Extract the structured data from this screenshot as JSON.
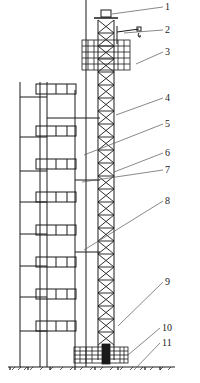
{
  "figure": {
    "type": "engineering-diagram"
  },
  "labels": [
    {
      "id": "1",
      "text": "1",
      "x": 165,
      "y": 2,
      "target": [
        112,
        14
      ]
    },
    {
      "id": "2",
      "text": "2",
      "x": 165,
      "y": 25,
      "target": [
        124,
        33
      ]
    },
    {
      "id": "3",
      "text": "3",
      "x": 165,
      "y": 47,
      "target": [
        136,
        64
      ]
    },
    {
      "id": "4",
      "text": "4",
      "x": 165,
      "y": 93,
      "target": [
        116,
        115
      ]
    },
    {
      "id": "5",
      "text": "5",
      "x": 165,
      "y": 119,
      "target": [
        84,
        155
      ]
    },
    {
      "id": "6",
      "text": "6",
      "x": 165,
      "y": 148,
      "target": [
        114,
        172
      ]
    },
    {
      "id": "7",
      "text": "7",
      "x": 165,
      "y": 165,
      "target": [
        82,
        182
      ]
    },
    {
      "id": "8",
      "text": "8",
      "x": 165,
      "y": 196,
      "target": [
        84,
        250
      ]
    },
    {
      "id": "9",
      "text": "9",
      "x": 165,
      "y": 277,
      "target": [
        118,
        326
      ]
    },
    {
      "id": "10",
      "text": "10",
      "x": 162,
      "y": 323,
      "target": [
        128,
        355
      ]
    },
    {
      "id": "11",
      "text": "11",
      "x": 162,
      "y": 338,
      "target": [
        134,
        370
      ]
    }
  ],
  "colors": {
    "line": "#1a1a1a",
    "leader": "#555555",
    "background": "#ffffff"
  }
}
